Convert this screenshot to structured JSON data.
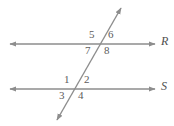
{
  "figure": {
    "type": "geometry-diagram",
    "width": 174,
    "height": 126,
    "background_color": "#ffffff",
    "stroke_color": "#8d8d8d",
    "label_color": "#5c5c5c",
    "line_label_color": "#4f4f4f"
  },
  "lines": [
    {
      "id": "line-r",
      "label": "R",
      "kind": "horizontal-parallel",
      "arrowheads": "both",
      "x1": 10,
      "y1": 44,
      "x2": 155,
      "y2": 44,
      "label_x": 162,
      "label_y": 37
    },
    {
      "id": "line-s",
      "label": "S",
      "kind": "horizontal-parallel",
      "arrowheads": "both",
      "x1": 10,
      "y1": 89,
      "x2": 155,
      "y2": 89,
      "label_x": 162,
      "label_y": 82
    },
    {
      "id": "line-transversal",
      "label": "",
      "kind": "transversal",
      "arrowheads": "both",
      "x1": 57,
      "y1": 120,
      "x2": 121,
      "y2": 8,
      "label_x": 0,
      "label_y": 0
    }
  ],
  "intersections": [
    {
      "id": "intersection-top",
      "on_line": "R",
      "x": 101,
      "y": 44
    },
    {
      "id": "intersection-bottom",
      "on_line": "S",
      "x": 75,
      "y": 89
    }
  ],
  "angles": [
    {
      "id": "angle-5",
      "label": "5",
      "intersection": "intersection-top",
      "position": "upper-left",
      "x": 89,
      "y": 30
    },
    {
      "id": "angle-6",
      "label": "6",
      "intersection": "intersection-top",
      "position": "upper-right",
      "x": 108,
      "y": 30
    },
    {
      "id": "angle-7",
      "label": "7",
      "intersection": "intersection-top",
      "position": "lower-left",
      "x": 85,
      "y": 46
    },
    {
      "id": "angle-8",
      "label": "8",
      "intersection": "intersection-top",
      "position": "lower-right",
      "x": 104,
      "y": 46
    },
    {
      "id": "angle-1",
      "label": "1",
      "intersection": "intersection-bottom",
      "position": "upper-left",
      "x": 64,
      "y": 75
    },
    {
      "id": "angle-2",
      "label": "2",
      "intersection": "intersection-bottom",
      "position": "upper-right",
      "x": 84,
      "y": 75
    },
    {
      "id": "angle-3",
      "label": "3",
      "intersection": "intersection-bottom",
      "position": "lower-left",
      "x": 59,
      "y": 91
    },
    {
      "id": "angle-4",
      "label": "4",
      "intersection": "intersection-bottom",
      "position": "lower-right",
      "x": 78,
      "y": 91
    }
  ]
}
